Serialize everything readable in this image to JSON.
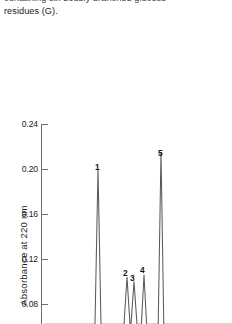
{
  "caption": {
    "line1": "containing six doubly branched glucose",
    "line2": "residues (G)."
  },
  "chart_data": {
    "type": "line",
    "title": "",
    "xlabel": "",
    "ylabel": "Absorbance at 220 nm",
    "ytick_labels": [
      "0.24",
      "0.20",
      "0.16",
      "0.12",
      "0.08"
    ],
    "ytick_values": [
      0.24,
      0.2,
      0.16,
      0.12,
      0.08
    ],
    "ylim": [
      0.06,
      0.25
    ],
    "grid": false,
    "legend": null,
    "annotations": [
      "1",
      "2",
      "3",
      "4",
      "5"
    ],
    "peaks": [
      {
        "label": "1",
        "x": 98,
        "height": 0.2,
        "width": 3.0
      },
      {
        "label": "2",
        "x": 127,
        "height": 0.104,
        "width": 3.0
      },
      {
        "label": "3",
        "x": 134,
        "height": 0.1,
        "width": 3.0
      },
      {
        "label": "4",
        "x": 144,
        "height": 0.106,
        "width": 2.6
      },
      {
        "label": "5",
        "x": 161,
        "height": 0.215,
        "width": 2.8
      }
    ],
    "series": [
      {
        "name": "chromatogram",
        "x": [
          1,
          2,
          3,
          4,
          5
        ],
        "values": [
          0.2,
          0.104,
          0.1,
          0.106,
          0.215
        ]
      }
    ]
  },
  "labels": {
    "peak1": "1",
    "peak2": "2",
    "peak3": "3",
    "peak4": "4",
    "peak5": "5"
  },
  "colors": {
    "axis": "#6d6d6d",
    "trace": "#5a5a5a",
    "text": "#1b1b1b",
    "background": "#ffffff"
  }
}
